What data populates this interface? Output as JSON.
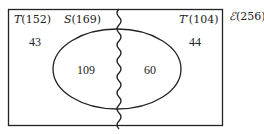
{
  "diagram": {
    "type": "venn",
    "universal": {
      "symbol": "ℰ",
      "count": "(256)"
    },
    "sets": [
      {
        "name": "T",
        "count": "(152)"
      },
      {
        "name": "S",
        "count": "(169)"
      },
      {
        "name": "T′",
        "count": "(104)"
      }
    ],
    "regions": {
      "t_only": "43",
      "s_and_t": "109",
      "s_and_t_prime": "60",
      "t_prime_only": "44"
    },
    "colors": {
      "stroke": "#222222",
      "background": "#ffffff"
    }
  }
}
